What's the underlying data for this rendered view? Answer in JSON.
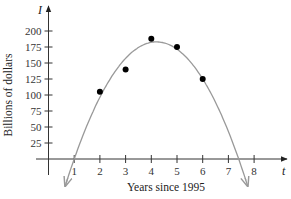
{
  "chart_data": {
    "type": "scatter",
    "title": "",
    "xlabel": "Years since 1995",
    "ylabel": "Billions of dollars",
    "x_var": "t",
    "y_var": "I",
    "x_ticks": [
      1,
      2,
      3,
      4,
      5,
      6,
      7,
      8
    ],
    "y_ticks": [
      25,
      50,
      75,
      100,
      125,
      150,
      175,
      200
    ],
    "xlim": [
      0,
      8.9
    ],
    "ylim": [
      0,
      210
    ],
    "grid": false,
    "legend": null,
    "series": [
      {
        "name": "data points",
        "type": "scatter",
        "x": [
          2,
          3,
          4,
          5,
          6
        ],
        "y": [
          105,
          140,
          188,
          175,
          125
        ],
        "color": "#000000"
      },
      {
        "name": "quadratic fit",
        "type": "line",
        "description": "Downward-opening parabola with arrows at both ends; crosses t-axis near t≈1 and t≈7.6, peak ≈183 near t≈4.2",
        "x": [
          0.7,
          1,
          2,
          3,
          4,
          4.2,
          5,
          6,
          7,
          7.6,
          8.1
        ],
        "y": [
          -30,
          0,
          97,
          152,
          181,
          183,
          171,
          128,
          55,
          0,
          -45
        ],
        "color": "#999999"
      }
    ]
  },
  "labels": {
    "x_title": "Years since 1995",
    "y_title": "Billions of dollars",
    "x_var": "t",
    "y_var": "I"
  }
}
